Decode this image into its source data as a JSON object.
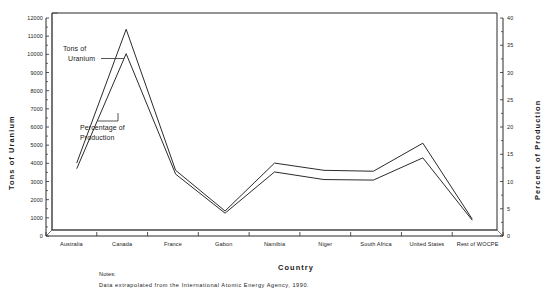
{
  "chart_data": {
    "type": "line",
    "title": "",
    "xlabel": "Country",
    "ylabel": "Tons of Uranium",
    "y2label": "Percent of Production",
    "categories": [
      "Australia",
      "Canada",
      "France",
      "Gabon",
      "Namibia",
      "Niger",
      "South Africa",
      "United States",
      "Rest of WOCPE"
    ],
    "ylim": [
      0,
      12000
    ],
    "y2lim": [
      0,
      40
    ],
    "yticks": [
      "0",
      "1000",
      "2000",
      "3000",
      "4000",
      "5000",
      "6000",
      "7000",
      "8000",
      "9000",
      "10000",
      "11000",
      "12000"
    ],
    "y2ticks": [
      "0",
      "5",
      "10",
      "15",
      "20",
      "25",
      "30",
      "35",
      "40"
    ],
    "grid": false,
    "legend_position": "inline-annotations",
    "series": [
      {
        "name": "Tons of Uranium",
        "axis": "left",
        "units": "tons",
        "values": [
          3700,
          11100,
          3300,
          1050,
          3700,
          3300,
          3250,
          4800,
          600
        ]
      },
      {
        "name": "Percentage of Production",
        "axis": "right",
        "units": "percent",
        "values": [
          11.3,
          32.5,
          10.3,
          3.1,
          10.7,
          9.3,
          9.2,
          13.3,
          1.8
        ]
      }
    ],
    "annotations": [
      {
        "id": "tons-annotation",
        "text_line1": "Tons of",
        "text_line2": "Uranium"
      },
      {
        "id": "percentage-annotation",
        "text_line1": "Percentage of",
        "text_line2": "Production"
      }
    ]
  },
  "notes": {
    "heading": "Notes:",
    "body": "Data extrapolated from the International Atomic Energy Agency, 1990."
  },
  "colors": {
    "line": "#2b2b2b",
    "axis": "#2b2b2b",
    "background": "#ffffff"
  }
}
